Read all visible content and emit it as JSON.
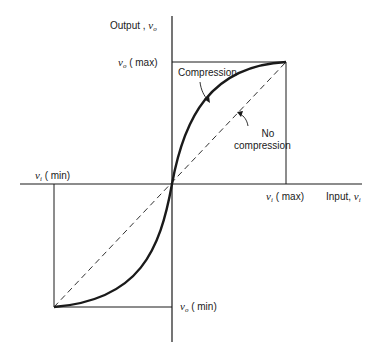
{
  "diagram": {
    "axes": {
      "y_label": {
        "text": "Output , ",
        "var": "v",
        "sub": "o"
      },
      "x_label": {
        "text": "Input, ",
        "var": "v",
        "sub": "i"
      }
    },
    "ticks": {
      "vo_max": {
        "var": "v",
        "sub": "o",
        "text": "( max)"
      },
      "vo_min": {
        "var": "v",
        "sub": "o",
        "text": "( min)"
      },
      "vi_max": {
        "var": "v",
        "sub": "i",
        "text": "( max)"
      },
      "vi_min": {
        "var": "v",
        "sub": "i",
        "text": "( min)"
      }
    },
    "curves": {
      "compression": {
        "label": "Compression",
        "style": "solid-thick"
      },
      "no_compression": {
        "label_line1": "No",
        "label_line2": "compression",
        "style": "dashed"
      }
    },
    "colors": {
      "line": "#1a1a1a",
      "background": "#ffffff"
    }
  }
}
